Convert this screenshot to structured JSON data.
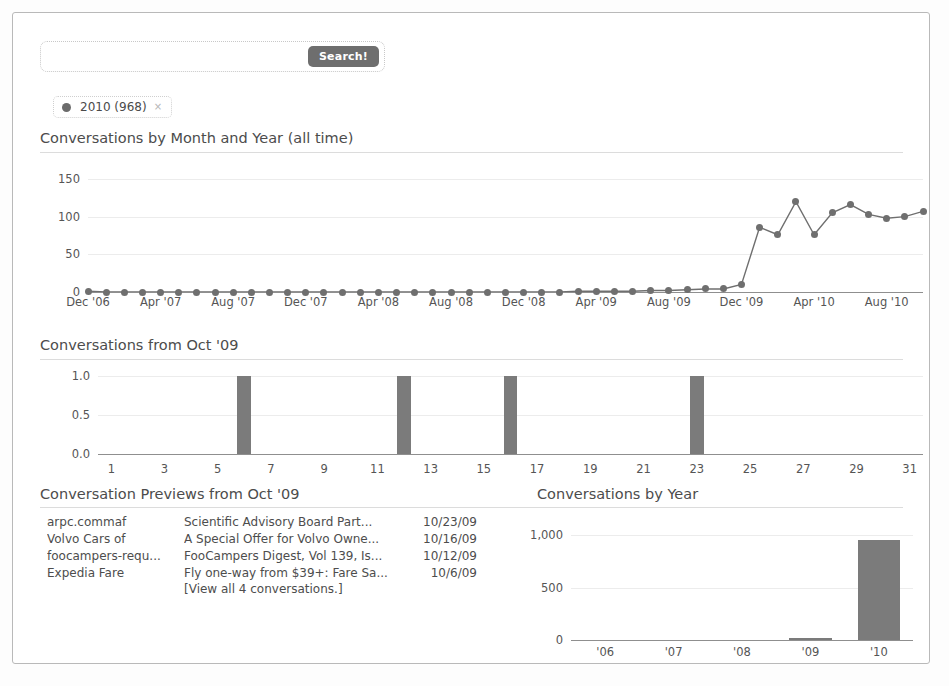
{
  "search": {
    "value": "",
    "placeholder": "",
    "button_label": "Search!"
  },
  "filter_chip": {
    "label": "2010 (968)",
    "close_label": "×"
  },
  "sections": {
    "month_title": "Conversations by Month and Year (all time)",
    "oct_title": "Conversations from Oct '09",
    "previews_title": "Conversation Previews from Oct '09",
    "year_title": "Conversations by Year"
  },
  "previews": {
    "rows": [
      {
        "from": "arpc.commaf",
        "subject": "Scientific Advisory Board Part...",
        "date": "10/23/09"
      },
      {
        "from": "Volvo Cars of",
        "subject": "A Special Offer for Volvo Owne...",
        "date": "10/16/09"
      },
      {
        "from": "foocampers-requ...",
        "subject": "FooCampers Digest, Vol 139, Is...",
        "date": "10/12/09"
      },
      {
        "from": "Expedia Fare",
        "subject": "Fly one-way from $39+: Fare Sa...",
        "date": "10/6/09"
      }
    ],
    "view_all": "[View all 4 conversations.]"
  },
  "chart_data": [
    {
      "id": "month",
      "type": "line",
      "title": "Conversations by Month and Year (all time)",
      "xlabel": "",
      "ylabel": "",
      "ylim": [
        0,
        150
      ],
      "yticks": [
        0,
        50,
        100,
        150
      ],
      "ytick_labels": [
        "0",
        "50",
        "100",
        "150"
      ],
      "grid": true,
      "legend": "none",
      "x": [
        "Dec '06",
        "Jan '07",
        "Feb '07",
        "Mar '07",
        "Apr '07",
        "May '07",
        "Jun '07",
        "Jul '07",
        "Aug '07",
        "Sep '07",
        "Oct '07",
        "Nov '07",
        "Dec '07",
        "Jan '08",
        "Feb '08",
        "Mar '08",
        "Apr '08",
        "May '08",
        "Jun '08",
        "Jul '08",
        "Aug '08",
        "Sep '08",
        "Oct '08",
        "Nov '08",
        "Dec '08",
        "Jan '09",
        "Feb '09",
        "Mar '09",
        "Apr '09",
        "May '09",
        "Jun '09",
        "Jul '09",
        "Aug '09",
        "Sep '09",
        "Oct '09",
        "Nov '09",
        "Dec '09",
        "Jan '10",
        "Feb '10",
        "Mar '10",
        "Apr '10",
        "May '10",
        "Jun '10",
        "Jul '10",
        "Aug '10",
        "Sep '10",
        "Oct '10"
      ],
      "xtick_labels": [
        "Dec '06",
        "Apr '07",
        "Aug '07",
        "Dec '07",
        "Apr '08",
        "Aug '08",
        "Dec '08",
        "Apr '09",
        "Aug '09",
        "Dec '09",
        "Apr '10",
        "Aug '10"
      ],
      "xtick_indices": [
        0,
        4,
        8,
        12,
        16,
        20,
        24,
        28,
        32,
        36,
        40,
        44
      ],
      "values": [
        1,
        0,
        0,
        0,
        0,
        0,
        0,
        0,
        0,
        0,
        0,
        0,
        0,
        0,
        0,
        0,
        0,
        0,
        0,
        0,
        0,
        0,
        0,
        0,
        0,
        0,
        0,
        1,
        1,
        1,
        1,
        2,
        2,
        3,
        4,
        4,
        10,
        86,
        76,
        120,
        76,
        105,
        116,
        103,
        98,
        100,
        107
      ]
    },
    {
      "id": "oct",
      "type": "bar",
      "title": "Conversations from Oct '09",
      "xlabel": "",
      "ylabel": "",
      "ylim": [
        0,
        1
      ],
      "yticks": [
        0,
        0.5,
        1
      ],
      "ytick_labels": [
        "0.0",
        "0.5",
        "1.0"
      ],
      "grid": true,
      "legend": "none",
      "categories": [
        "1",
        "2",
        "3",
        "4",
        "5",
        "6",
        "7",
        "8",
        "9",
        "10",
        "11",
        "12",
        "13",
        "14",
        "15",
        "16",
        "17",
        "18",
        "19",
        "20",
        "21",
        "22",
        "23",
        "24",
        "25",
        "26",
        "27",
        "28",
        "29",
        "30",
        "31"
      ],
      "xtick_labels": [
        "1",
        "3",
        "5",
        "7",
        "9",
        "11",
        "13",
        "15",
        "17",
        "19",
        "21",
        "23",
        "25",
        "27",
        "29",
        "31"
      ],
      "values": [
        0,
        0,
        0,
        0,
        0,
        1,
        0,
        0,
        0,
        0,
        0,
        1,
        0,
        0,
        0,
        1,
        0,
        0,
        0,
        0,
        0,
        0,
        1,
        0,
        0,
        0,
        0,
        0,
        0,
        0,
        0
      ]
    },
    {
      "id": "year",
      "type": "bar",
      "title": "Conversations by Year",
      "xlabel": "",
      "ylabel": "",
      "ylim": [
        0,
        1000
      ],
      "yticks": [
        0,
        500,
        1000
      ],
      "ytick_labels": [
        "0",
        "500",
        "1,000"
      ],
      "grid": true,
      "legend": "none",
      "categories": [
        "'06",
        "'07",
        "'08",
        "'09",
        "'10"
      ],
      "xtick_labels": [
        "'06",
        "'07",
        "'08",
        "'09",
        "'10"
      ],
      "values": [
        0,
        0,
        0,
        18,
        950
      ]
    }
  ],
  "colors": {
    "bar": "#7b7b7b",
    "line": "#6f6f6f",
    "grid": "#ececec",
    "axis": "#8f8f8f",
    "button": "#6e6e6e",
    "text": "#4c4c4c"
  }
}
